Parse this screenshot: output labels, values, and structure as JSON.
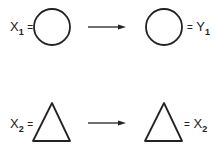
{
  "rows": [
    {
      "left_label": {
        "var": "X",
        "sub": "1",
        "eq": "="
      },
      "left_shape": "circle",
      "arrow": "right-arrow",
      "right_shape": "circle",
      "right_label": {
        "eq": "=",
        "var": "Y",
        "sub": "1"
      }
    },
    {
      "left_label": {
        "var": "X",
        "sub": "2",
        "eq": "="
      },
      "left_shape": "triangle",
      "arrow": "right-arrow",
      "right_shape": "triangle",
      "right_label": {
        "eq": "=",
        "var": "X",
        "sub": "2"
      }
    }
  ],
  "colors": {
    "stroke": "#222222",
    "background": "#ffffff"
  }
}
